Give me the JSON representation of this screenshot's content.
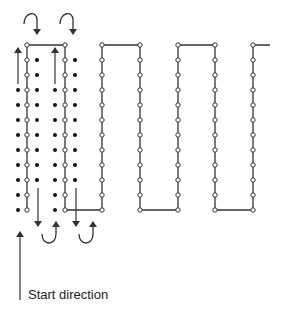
{
  "diagram": {
    "start_label": "Start direction",
    "colors": {
      "line": "#333333",
      "dot": "#111111",
      "background": "#ffffff"
    },
    "path": {
      "columns_x": [
        27,
        65,
        102,
        140,
        178,
        215,
        253
      ],
      "top_y": 45,
      "bottom_y": 210,
      "row_spacing": 15,
      "tail_end_x": 270
    },
    "filled_dot_columns": [
      {
        "x": 18,
        "y_from": 90,
        "y_to": 210
      },
      {
        "x": 37,
        "y_from": 60,
        "y_to": 180
      },
      {
        "x": 55,
        "y_from": 90,
        "y_to": 210
      },
      {
        "x": 75,
        "y_from": 60,
        "y_to": 180
      }
    ],
    "arrows": {
      "up": [
        {
          "x": 18,
          "y1": 84,
          "y2": 48
        },
        {
          "x": 55,
          "y1": 84,
          "y2": 48
        }
      ],
      "down": [
        {
          "x": 38,
          "y1": 188,
          "y2": 226
        },
        {
          "x": 76,
          "y1": 188,
          "y2": 226
        }
      ],
      "top_uturns": [
        {
          "x1": 24,
          "x2": 37
        },
        {
          "x1": 60,
          "x2": 73
        }
      ],
      "bottom_uturns": [
        {
          "x1": 42,
          "x2": 56
        },
        {
          "x1": 79,
          "x2": 93
        }
      ],
      "start": {
        "x": 20,
        "y1": 300,
        "y2": 232
      }
    }
  }
}
